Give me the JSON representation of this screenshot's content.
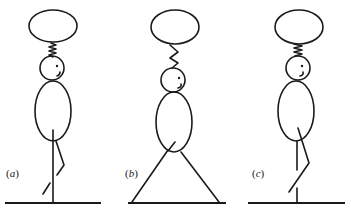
{
  "figure": {
    "stroke_color": "#1a1a1a",
    "background": "#ffffff",
    "panels": [
      {
        "id": "a",
        "label_open": "(",
        "label_letter": "a",
        "label_close": ")",
        "posture": "standing on one straight leg, other leg bent back"
      },
      {
        "id": "b",
        "label_open": "(",
        "label_letter": "b",
        "label_close": ")",
        "posture": "standing with legs spread wide in a triangle"
      },
      {
        "id": "c",
        "label_open": "(",
        "label_letter": "c",
        "label_close": ")",
        "posture": "standing with one leg crossed/bent in front"
      }
    ]
  }
}
